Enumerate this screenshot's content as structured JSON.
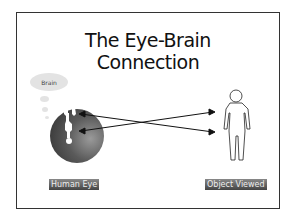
{
  "slide": {
    "title_line1": "The Eye-Brain",
    "title_line2": "Connection",
    "thought_bubble_label": "Brain",
    "eye_label": "Human Eye",
    "object_label": "Object Viewed"
  }
}
